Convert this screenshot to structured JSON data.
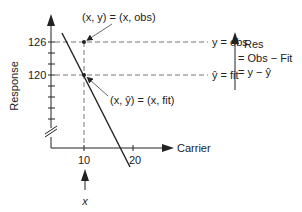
{
  "diagram": {
    "y_axis": {
      "label": "Response",
      "ticks": [
        {
          "value": "126",
          "y": 42
        },
        {
          "value": "120",
          "y": 75
        }
      ],
      "has_axis_break": true
    },
    "x_axis": {
      "label": "Carrier",
      "ticks": [
        {
          "value": "10",
          "x": 84
        },
        {
          "value": "20",
          "x": 133
        }
      ]
    },
    "x_marker": {
      "label": "x",
      "at_value": "10"
    },
    "observed_point": {
      "annotation": "(x, y) = (x, obs)",
      "guide_label": "y = obs",
      "y_value": 126
    },
    "fitted_point": {
      "annotation": "(x, ŷ) = (x, fit)",
      "guide_label": "ŷ = fit",
      "y_value": 120
    },
    "residual_note": {
      "line1": "Res",
      "line2": "= Obs − Fit",
      "line3": "= y − ŷ"
    },
    "colors": {
      "ink": "#222222",
      "dashed": "#666666",
      "background": "#ffffff"
    }
  }
}
